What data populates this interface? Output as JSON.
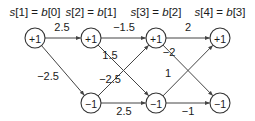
{
  "stages": [
    {
      "id": "s1",
      "header_s": "s",
      "header_s_idx": "[1] = ",
      "header_b": "b",
      "header_b_idx": "[0]",
      "states": [
        "+1"
      ]
    },
    {
      "id": "s2",
      "header_s": "s",
      "header_s_idx": "[2] = ",
      "header_b": "b",
      "header_b_idx": "[1]",
      "states": [
        "+1",
        "−1"
      ]
    },
    {
      "id": "s3",
      "header_s": "s",
      "header_s_idx": "[3] = ",
      "header_b": "b",
      "header_b_idx": "[2]",
      "states": [
        "+1",
        "−1"
      ]
    },
    {
      "id": "s4",
      "header_s": "s",
      "header_s_idx": "[4] = ",
      "header_b": "b",
      "header_b_idx": "[3]",
      "states": [
        "+1",
        "−1"
      ]
    }
  ],
  "edges": [
    {
      "from": [
        0,
        0
      ],
      "to": [
        1,
        0
      ],
      "weight": "2.5"
    },
    {
      "from": [
        0,
        0
      ],
      "to": [
        1,
        1
      ],
      "weight": "−2.5"
    },
    {
      "from": [
        1,
        0
      ],
      "to": [
        2,
        0
      ],
      "weight": "−1.5"
    },
    {
      "from": [
        1,
        0
      ],
      "to": [
        2,
        1
      ],
      "weight": "1.5"
    },
    {
      "from": [
        1,
        1
      ],
      "to": [
        2,
        0
      ],
      "weight": "−2.5"
    },
    {
      "from": [
        1,
        1
      ],
      "to": [
        2,
        1
      ],
      "weight": "2.5"
    },
    {
      "from": [
        2,
        0
      ],
      "to": [
        3,
        0
      ],
      "weight": "2"
    },
    {
      "from": [
        2,
        0
      ],
      "to": [
        3,
        1
      ],
      "weight": "−2"
    },
    {
      "from": [
        2,
        1
      ],
      "to": [
        3,
        0
      ],
      "weight": "1"
    },
    {
      "from": [
        2,
        1
      ],
      "to": [
        3,
        1
      ],
      "weight": "−1"
    }
  ]
}
